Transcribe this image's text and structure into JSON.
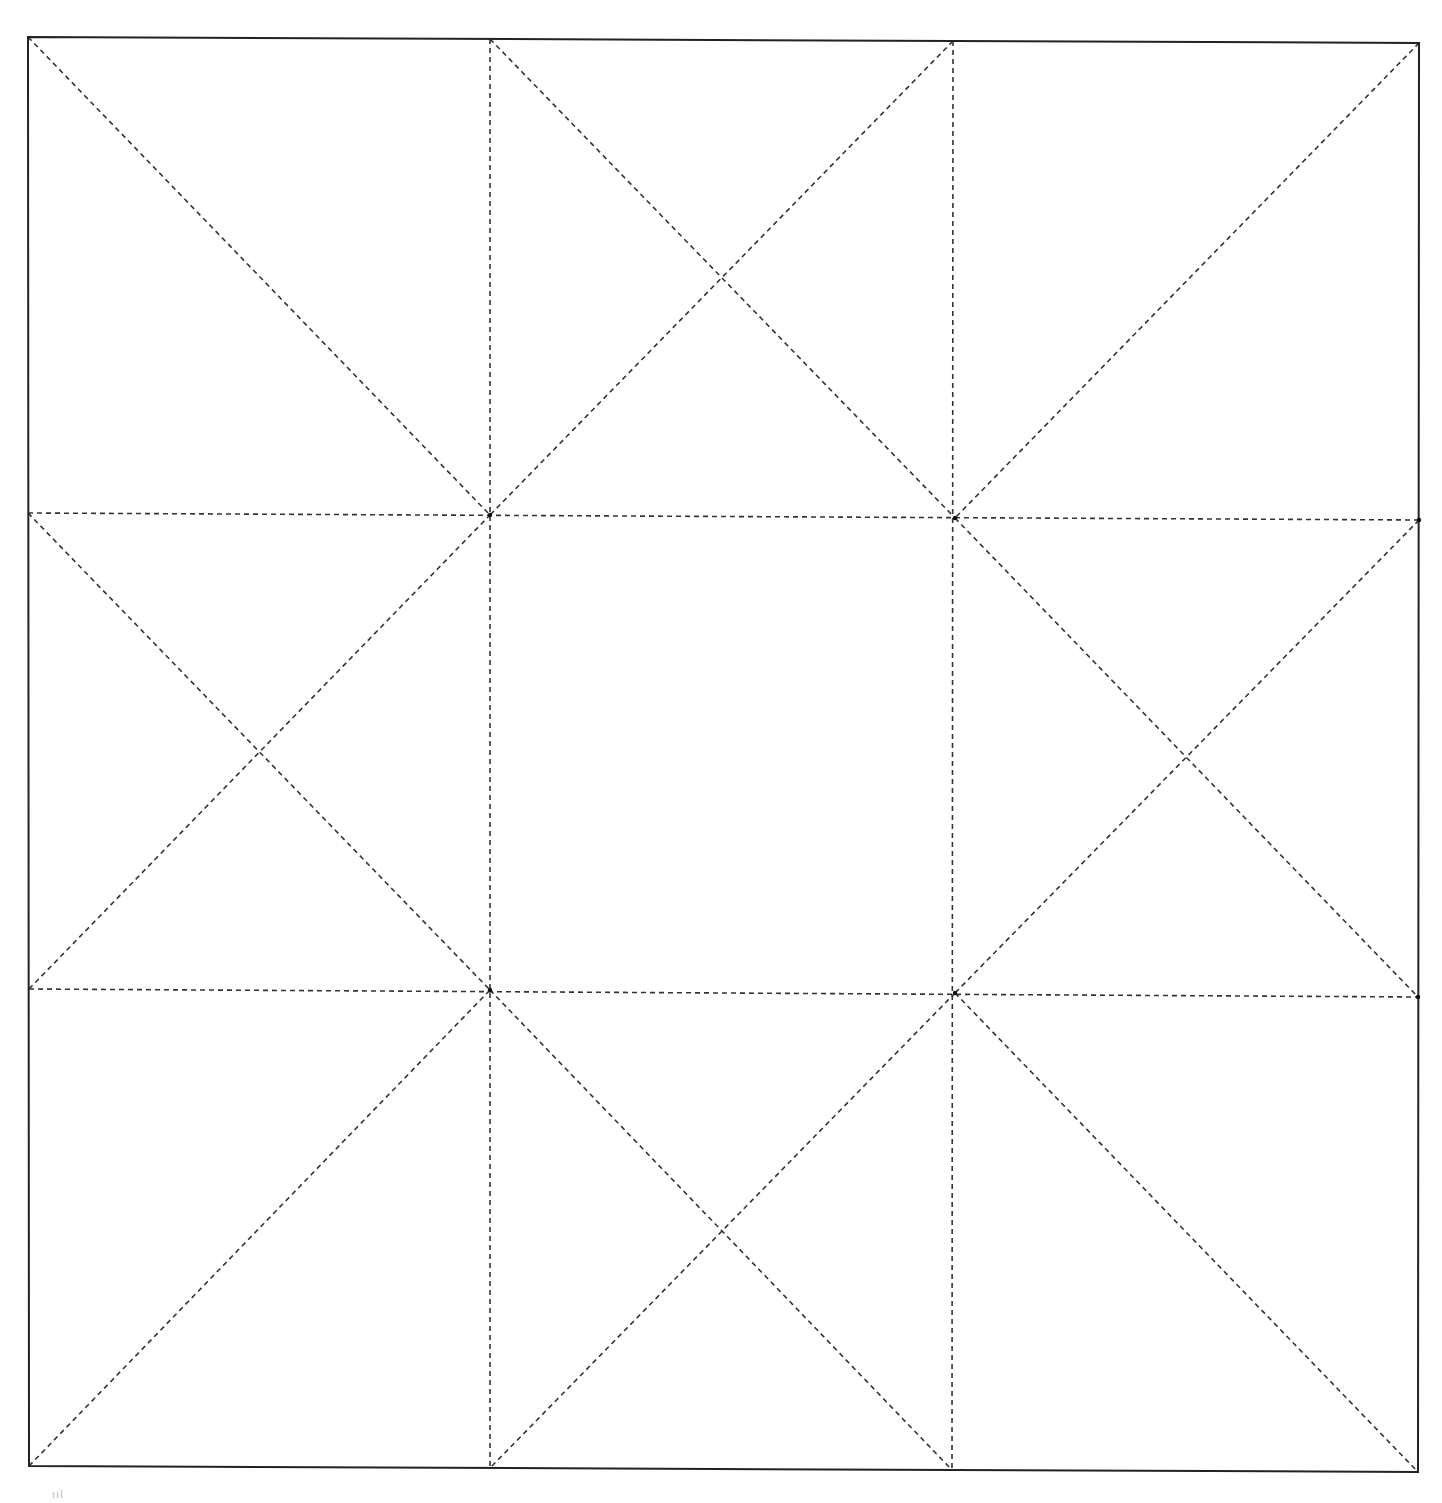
{
  "diagram": {
    "type": "folding-pattern-grid",
    "colors": {
      "border": "#222222",
      "dash": "#333333",
      "background": "#ffffff"
    },
    "outer_square": {
      "top_left": [
        28,
        37
      ],
      "top_right": [
        1419,
        43
      ],
      "bottom_right": [
        1418,
        1472
      ],
      "bottom_left": [
        29,
        1466
      ]
    },
    "grid_points": {
      "v1_top": [
        490,
        39
      ],
      "v2_top": [
        953,
        41
      ],
      "v1_bottom": [
        490,
        1468
      ],
      "v2_bottom": [
        952,
        1470
      ],
      "h1_left": [
        28,
        513
      ],
      "h1_right": [
        1419,
        520
      ],
      "h2_left": [
        29,
        989
      ],
      "h2_right": [
        1418,
        997
      ],
      "p11": [
        490,
        515
      ],
      "p12": [
        955,
        518
      ],
      "p21": [
        490,
        990
      ],
      "p22": [
        955,
        993
      ]
    },
    "lines": [
      {
        "name": "vertical-line-1",
        "from": [
          490,
          39
        ],
        "to": [
          490,
          1468
        ],
        "style": "dashed"
      },
      {
        "name": "vertical-line-2",
        "from": [
          953,
          41
        ],
        "to": [
          952,
          1470
        ],
        "style": "dashed"
      },
      {
        "name": "horizontal-line-1",
        "from": [
          28,
          513
        ],
        "to": [
          1419,
          520
        ],
        "style": "dashed"
      },
      {
        "name": "horizontal-line-2",
        "from": [
          29,
          989
        ],
        "to": [
          1418,
          997
        ],
        "style": "dashed"
      },
      {
        "name": "diagonal-top-left",
        "from": [
          28,
          37
        ],
        "to": [
          490,
          515
        ],
        "style": "dashed"
      },
      {
        "name": "diagonal-top-center-a",
        "from": [
          490,
          39
        ],
        "to": [
          955,
          518
        ],
        "style": "dashed"
      },
      {
        "name": "diagonal-top-center-b",
        "from": [
          953,
          41
        ],
        "to": [
          490,
          515
        ],
        "style": "dashed"
      },
      {
        "name": "diagonal-top-right",
        "from": [
          1419,
          43
        ],
        "to": [
          955,
          518
        ],
        "style": "dashed"
      },
      {
        "name": "diagonal-mid-left-a",
        "from": [
          28,
          513
        ],
        "to": [
          490,
          990
        ],
        "style": "dashed"
      },
      {
        "name": "diagonal-mid-left-b",
        "from": [
          29,
          989
        ],
        "to": [
          490,
          515
        ],
        "style": "dashed"
      },
      {
        "name": "diagonal-mid-right-a",
        "from": [
          955,
          518
        ],
        "to": [
          1418,
          997
        ],
        "style": "dashed"
      },
      {
        "name": "diagonal-mid-right-b",
        "from": [
          1419,
          520
        ],
        "to": [
          955,
          993
        ],
        "style": "dashed"
      },
      {
        "name": "diagonal-bottom-left",
        "from": [
          29,
          1466
        ],
        "to": [
          490,
          990
        ],
        "style": "dashed"
      },
      {
        "name": "diagonal-bottom-center-a",
        "from": [
          490,
          990
        ],
        "to": [
          952,
          1470
        ],
        "style": "dashed"
      },
      {
        "name": "diagonal-bottom-center-b",
        "from": [
          955,
          993
        ],
        "to": [
          490,
          1468
        ],
        "style": "dashed"
      },
      {
        "name": "diagonal-bottom-right",
        "from": [
          955,
          993
        ],
        "to": [
          1418,
          1472
        ],
        "style": "dashed"
      }
    ],
    "corner_mark": "ııl"
  }
}
